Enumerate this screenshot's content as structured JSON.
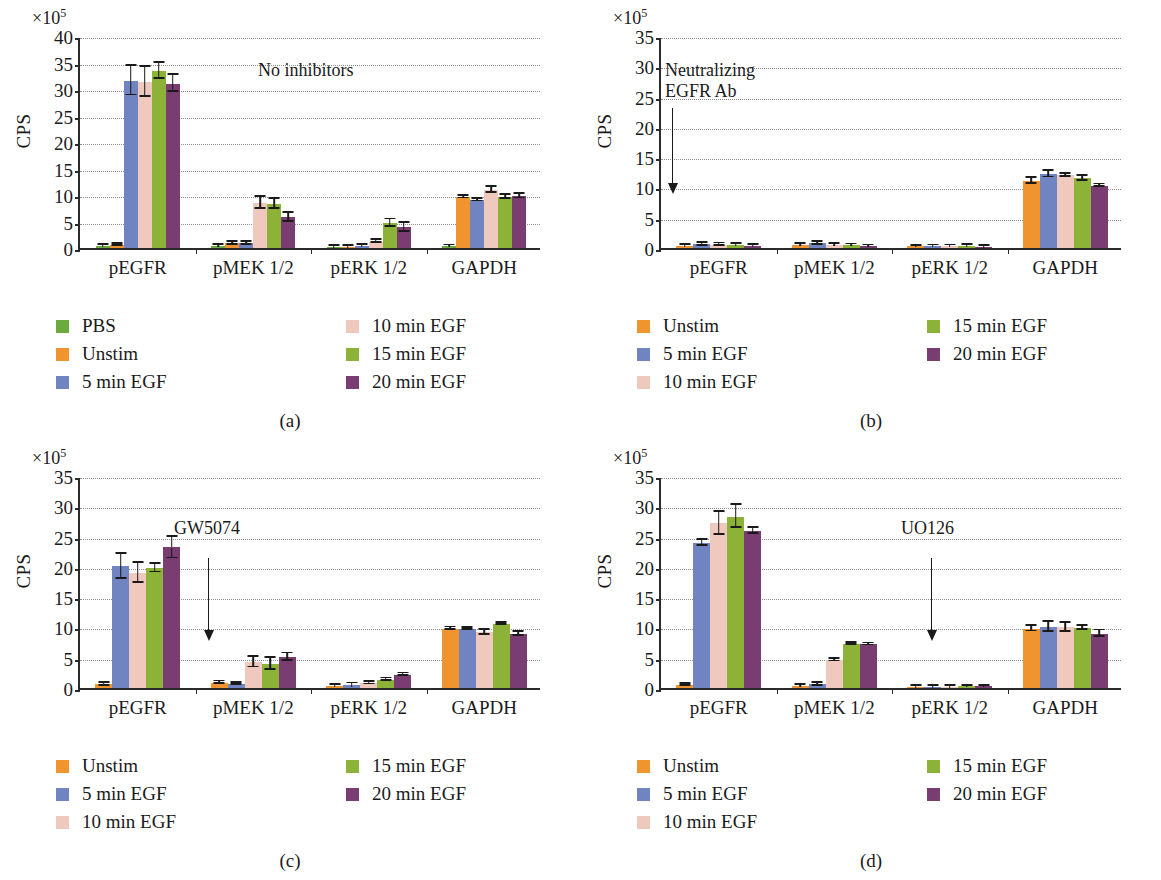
{
  "figure": {
    "y_axis_label": "CPS",
    "axis_multiplier": "×10",
    "axis_multiplier_exp": "5",
    "categories": [
      "pEGFR",
      "pMEK 1/2",
      "pERK 1/2",
      "GAPDH"
    ]
  },
  "series_colors": {
    "PBS": "#6aaa3f",
    "Unstim": "#f0942f",
    "5 min EGF": "#6f84c0",
    "10 min EGF": "#efc9bd",
    "15 min EGF": "#8cb338",
    "20 min EGF": "#7a3d71"
  },
  "panels": [
    {
      "id": "a",
      "caption": "(a)",
      "annotation": {
        "text": "No inhibitors",
        "has_arrow": false
      },
      "legend": [
        {
          "label": "PBS",
          "color": "#6aaa3f"
        },
        {
          "label": "Unstim",
          "color": "#f0942f"
        },
        {
          "label": "5 min EGF",
          "color": "#6f84c0"
        },
        {
          "label": "10 min EGF",
          "color": "#efc9bd"
        },
        {
          "label": "15 min EGF",
          "color": "#8cb338"
        },
        {
          "label": "20 min EGF",
          "color": "#7a3d71"
        }
      ],
      "chart_data": {
        "type": "bar",
        "title": "No inhibitors",
        "xlabel": "",
        "ylabel": "CPS",
        "ylim": [
          0,
          40
        ],
        "yticks": [
          0,
          5,
          10,
          15,
          20,
          25,
          30,
          35,
          40
        ],
        "y_scale_note": "×10^5",
        "grid": true,
        "legend_position": "below",
        "categories": [
          "pEGFR",
          "pMEK 1/2",
          "pERK 1/2",
          "GAPDH"
        ],
        "series": [
          {
            "name": "PBS",
            "values": [
              0.4,
              0.4,
              0.25,
              0.4
            ],
            "errors": [
              0.15,
              0.15,
              0.1,
              0.1
            ]
          },
          {
            "name": "Unstim",
            "values": [
              0.6,
              0.9,
              0.25,
              9.6
            ],
            "errors": [
              0.2,
              0.25,
              0.1,
              0.25
            ]
          },
          {
            "name": "5 min EGF",
            "values": [
              31.6,
              0.9,
              0.4,
              9.0
            ],
            "errors": [
              2.8,
              0.3,
              0.15,
              0.2
            ]
          },
          {
            "name": "10 min EGF",
            "values": [
              31.3,
              8.5,
              1.2,
              11.0
            ],
            "errors": [
              2.8,
              1.1,
              0.3,
              0.6
            ]
          },
          {
            "name": "15 min EGF",
            "values": [
              33.4,
              8.3,
              4.7,
              9.6
            ],
            "errors": [
              1.5,
              0.9,
              0.7,
              0.35
            ]
          },
          {
            "name": "20 min EGF",
            "values": [
              31.0,
              5.8,
              3.9,
              9.8
            ],
            "errors": [
              1.6,
              0.9,
              0.8,
              0.45
            ]
          }
        ]
      }
    },
    {
      "id": "b",
      "caption": "(b)",
      "annotation": {
        "text": "Neutralizing\nEGFR Ab",
        "has_arrow": true
      },
      "legend": [
        {
          "label": "Unstim",
          "color": "#f0942f"
        },
        {
          "label": "5 min EGF",
          "color": "#6f84c0"
        },
        {
          "label": "10 min EGF",
          "color": "#efc9bd"
        },
        {
          "label": "15 min EGF",
          "color": "#8cb338"
        },
        {
          "label": "20 min EGF",
          "color": "#7a3d71"
        }
      ],
      "chart_data": {
        "type": "bar",
        "title": "Neutralizing EGFR Ab",
        "xlabel": "",
        "ylabel": "CPS",
        "ylim": [
          0,
          35
        ],
        "yticks": [
          0,
          5,
          10,
          15,
          20,
          25,
          30,
          35
        ],
        "y_scale_note": "×10^5",
        "grid": true,
        "legend_position": "below",
        "categories": [
          "pEGFR",
          "pMEK 1/2",
          "pERK 1/2",
          "GAPDH"
        ],
        "series": [
          {
            "name": "Unstim",
            "values": [
              0.35,
              0.5,
              0.3,
              11.1
            ],
            "errors": [
              0.15,
              0.2,
              0.1,
              0.45
            ]
          },
          {
            "name": "5 min EGF",
            "values": [
              0.6,
              0.75,
              0.3,
              12.2
            ],
            "errors": [
              0.25,
              0.25,
              0.12,
              0.55
            ]
          },
          {
            "name": "10 min EGF",
            "values": [
              0.55,
              0.5,
              0.3,
              12.0
            ],
            "errors": [
              0.2,
              0.2,
              0.12,
              0.3
            ]
          },
          {
            "name": "15 min EGF",
            "values": [
              0.5,
              0.45,
              0.35,
              11.5
            ],
            "errors": [
              0.2,
              0.15,
              0.12,
              0.45
            ]
          },
          {
            "name": "20 min EGF",
            "values": [
              0.4,
              0.3,
              0.25,
              10.3
            ],
            "errors": [
              0.15,
              0.12,
              0.1,
              0.2
            ]
          }
        ]
      }
    },
    {
      "id": "c",
      "caption": "(c)",
      "annotation": {
        "text": "GW5074",
        "has_arrow": true
      },
      "legend": [
        {
          "label": "Unstim",
          "color": "#f0942f"
        },
        {
          "label": "5 min EGF",
          "color": "#6f84c0"
        },
        {
          "label": "10 min EGF",
          "color": "#efc9bd"
        },
        {
          "label": "15 min EGF",
          "color": "#8cb338"
        },
        {
          "label": "20 min EGF",
          "color": "#7a3d71"
        }
      ],
      "chart_data": {
        "type": "bar",
        "title": "GW5074",
        "xlabel": "",
        "ylabel": "CPS",
        "ylim": [
          0,
          35
        ],
        "yticks": [
          0,
          5,
          10,
          15,
          20,
          25,
          30,
          35
        ],
        "y_scale_note": "×10^5",
        "grid": true,
        "legend_position": "below",
        "categories": [
          "pEGFR",
          "pMEK 1/2",
          "pERK 1/2",
          "GAPDH"
        ],
        "series": [
          {
            "name": "Unstim",
            "values": [
              0.6,
              0.9,
              0.4,
              9.8
            ],
            "errors": [
              0.2,
              0.2,
              0.15,
              0.2
            ]
          },
          {
            "name": "5 min EGF",
            "values": [
              20.1,
              0.7,
              0.5,
              9.8
            ],
            "errors": [
              2.1,
              0.2,
              0.25,
              0.15
            ]
          },
          {
            "name": "10 min EGF",
            "values": [
              19.0,
              4.3,
              0.8,
              9.2
            ],
            "errors": [
              1.7,
              0.9,
              0.2,
              0.4
            ]
          },
          {
            "name": "15 min EGF",
            "values": [
              19.8,
              4.0,
              1.4,
              10.6
            ],
            "errors": [
              0.7,
              1.0,
              0.2,
              0.2
            ]
          },
          {
            "name": "20 min EGF",
            "values": [
              23.2,
              5.1,
              2.2,
              8.9
            ],
            "errors": [
              1.8,
              0.6,
              0.2,
              0.3
            ]
          }
        ]
      }
    },
    {
      "id": "d",
      "caption": "(d)",
      "annotation": {
        "text": "UO126",
        "has_arrow": true
      },
      "legend": [
        {
          "label": "Unstim",
          "color": "#f0942f"
        },
        {
          "label": "5 min EGF",
          "color": "#6f84c0"
        },
        {
          "label": "10 min EGF",
          "color": "#efc9bd"
        },
        {
          "label": "15 min EGF",
          "color": "#8cb338"
        },
        {
          "label": "20 min EGF",
          "color": "#7a3d71"
        }
      ],
      "chart_data": {
        "type": "bar",
        "title": "UO126",
        "xlabel": "",
        "ylabel": "CPS",
        "ylim": [
          0,
          35
        ],
        "yticks": [
          0,
          5,
          10,
          15,
          20,
          25,
          30,
          35
        ],
        "y_scale_note": "×10^5",
        "grid": true,
        "legend_position": "below",
        "categories": [
          "pEGFR",
          "pMEK 1/2",
          "pERK 1/2",
          "GAPDH"
        ],
        "series": [
          {
            "name": "Unstim",
            "values": [
              0.55,
              0.4,
              0.25,
              9.8
            ],
            "errors": [
              0.15,
              0.12,
              0.1,
              0.45
            ]
          },
          {
            "name": "5 min EGF",
            "values": [
              24.0,
              0.6,
              0.2,
              10.1
            ],
            "errors": [
              0.5,
              0.2,
              0.08,
              0.8
            ]
          },
          {
            "name": "10 min EGF",
            "values": [
              27.2,
              4.6,
              0.25,
              10.0
            ],
            "errors": [
              1.9,
              0.2,
              0.08,
              0.7
            ]
          },
          {
            "name": "15 min EGF",
            "values": [
              28.3,
              7.3,
              0.3,
              9.9
            ],
            "errors": [
              1.9,
              0.2,
              0.1,
              0.35
            ]
          },
          {
            "name": "20 min EGF",
            "values": [
              26.0,
              7.2,
              0.3,
              9.0
            ],
            "errors": [
              0.5,
              0.15,
              0.1,
              0.5
            ]
          }
        ]
      }
    }
  ]
}
